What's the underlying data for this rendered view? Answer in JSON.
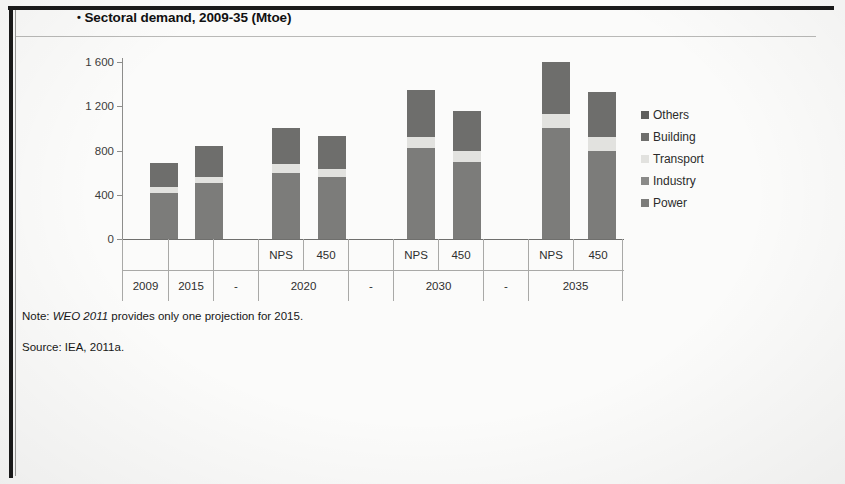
{
  "figure": {
    "bullet": "•",
    "title": "Sectoral demand, 2009-35 (Mtoe)",
    "note_prefix": "Note: ",
    "note_italic": "WEO 2011",
    "note_rest": " provides only one projection for 2015.",
    "source": "Source: IEA, 2011a."
  },
  "legend": {
    "items": [
      {
        "label": "Others",
        "color": "#5f5f5d"
      },
      {
        "label": "Building",
        "color": "#6e6e6c"
      },
      {
        "label": "Transport",
        "color": "#e2e2df"
      },
      {
        "label": "Industry",
        "color": "#8a8a88"
      },
      {
        "label": "Power",
        "color": "#7c7c7a"
      }
    ]
  },
  "axis": {
    "y_ticks": [
      "1 600",
      "1 200",
      "800",
      "400",
      "0"
    ],
    "y_tick_values": [
      1600,
      1200,
      800,
      400,
      0
    ],
    "x_row_scenarios": [
      "",
      "",
      "",
      "NPS",
      "450",
      "",
      "NPS",
      "450",
      "",
      "NPS",
      "450"
    ],
    "x_row_years": [
      "2009",
      "2015",
      "-",
      "2020",
      "-",
      "2030",
      "-",
      "2035"
    ]
  },
  "chart_data": {
    "type": "bar",
    "subtype": "stacked-column",
    "title": "Sectoral demand, 2009-35 (Mtoe)",
    "xlabel": "",
    "ylabel": "Mtoe",
    "ylim": [
      0,
      1600
    ],
    "yticks": [
      0,
      400,
      800,
      1200,
      1600
    ],
    "grid": false,
    "legend_position": "right",
    "categories": [
      "2009",
      "2015",
      "2020 NPS",
      "2020 450",
      "2030 NPS",
      "2030 450",
      "2035 NPS",
      "2035 450"
    ],
    "series": [
      {
        "name": "Power",
        "color": "#7c7c7a",
        "values": [
          420,
          505,
          600,
          560,
          820,
          700,
          1000,
          800
        ]
      },
      {
        "name": "Industry",
        "color": "#8a8a88",
        "values": [
          0,
          0,
          0,
          0,
          0,
          0,
          0,
          0
        ]
      },
      {
        "name": "Transport",
        "color": "#e2e2df",
        "values": [
          50,
          60,
          75,
          70,
          105,
          100,
          130,
          120
        ]
      },
      {
        "name": "Building",
        "color": "#6e6e6c",
        "values": [
          220,
          275,
          330,
          300,
          425,
          360,
          470,
          410
        ]
      },
      {
        "name": "Others",
        "color": "#5f5f5d",
        "values": [
          0,
          0,
          0,
          0,
          0,
          0,
          0,
          0
        ]
      }
    ],
    "totals": [
      690,
      840,
      1005,
      930,
      1350,
      1160,
      1600,
      1330
    ],
    "annotations": [
      "WEO 2011 provides only one projection for 2015.",
      "Source: IEA, 2011a."
    ]
  },
  "bars": [
    {
      "key": "2009",
      "x": 28,
      "segments": [
        420,
        0,
        50,
        220,
        0
      ]
    },
    {
      "key": "2015",
      "x": 73,
      "segments": [
        505,
        0,
        60,
        275,
        0
      ]
    },
    {
      "key": "2020-NPS",
      "x": 150,
      "segments": [
        600,
        0,
        75,
        330,
        0
      ]
    },
    {
      "key": "2020-450",
      "x": 196,
      "segments": [
        560,
        0,
        70,
        300,
        0
      ]
    },
    {
      "key": "2030-NPS",
      "x": 285,
      "segments": [
        820,
        0,
        105,
        425,
        0
      ]
    },
    {
      "key": "2030-450",
      "x": 331,
      "segments": [
        700,
        0,
        100,
        360,
        0
      ]
    },
    {
      "key": "2035-NPS",
      "x": 420,
      "segments": [
        1000,
        0,
        130,
        470,
        0
      ]
    },
    {
      "key": "2035-450",
      "x": 466,
      "segments": [
        800,
        0,
        120,
        410,
        0
      ]
    }
  ],
  "xcells": {
    "row1": [
      {
        "label": "",
        "x": 0,
        "w": 46
      },
      {
        "label": "",
        "x": 46,
        "w": 45
      },
      {
        "label": "",
        "x": 91,
        "w": 45
      },
      {
        "label": "NPS",
        "x": 136,
        "w": 45
      },
      {
        "label": "450",
        "x": 181,
        "w": 45
      },
      {
        "label": "",
        "x": 226,
        "w": 45
      },
      {
        "label": "NPS",
        "x": 271,
        "w": 45
      },
      {
        "label": "450",
        "x": 316,
        "w": 45
      },
      {
        "label": "",
        "x": 361,
        "w": 45
      },
      {
        "label": "NPS",
        "x": 406,
        "w": 45
      },
      {
        "label": "450",
        "x": 451,
        "w": 50
      }
    ],
    "row2": [
      {
        "label": "2009",
        "x": 0,
        "w": 46
      },
      {
        "label": "2015",
        "x": 46,
        "w": 45
      },
      {
        "label": "-",
        "x": 91,
        "w": 45
      },
      {
        "label": "2020",
        "x": 136,
        "w": 90
      },
      {
        "label": "-",
        "x": 226,
        "w": 45
      },
      {
        "label": "2030",
        "x": 271,
        "w": 90
      },
      {
        "label": "-",
        "x": 361,
        "w": 45
      },
      {
        "label": "2035",
        "x": 406,
        "w": 95
      }
    ]
  }
}
